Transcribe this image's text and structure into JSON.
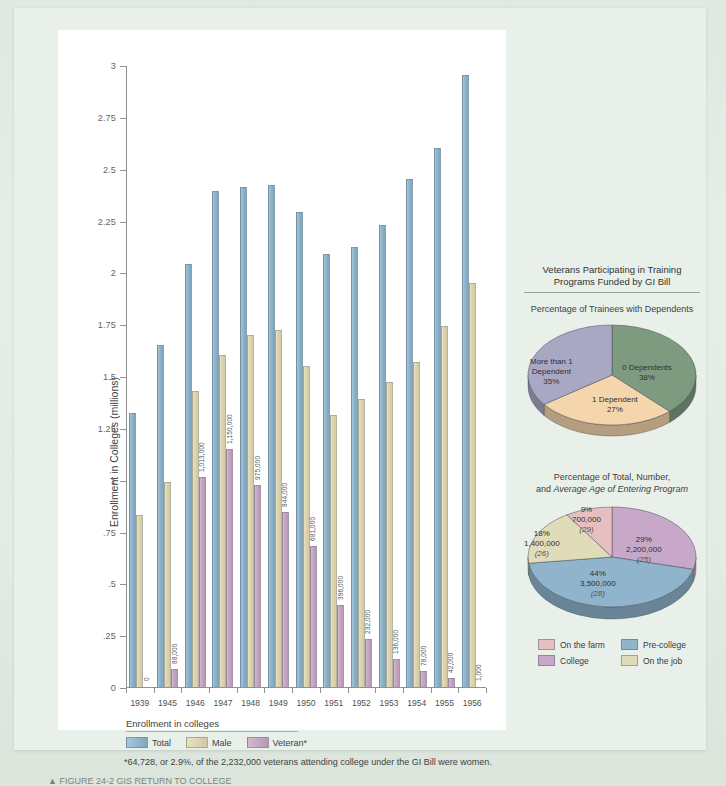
{
  "page": {
    "background_color": "#e2ebe2",
    "panel_color": "#ffffff"
  },
  "colors": {
    "total": "#8fb4cc",
    "male": "#ddd5b0",
    "veteran": "#c4a6c0",
    "pie1_zero": "#7e9b80",
    "pie1_one": "#f5d5ac",
    "pie1_more": "#a8a8c4",
    "pie2_farm": "#e8bfc0",
    "pie2_precollege": "#8fb4cc",
    "pie2_college": "#c8a8c8",
    "pie2_job": "#e0dcba"
  },
  "bar_legend": {
    "title": "Enrollment in colleges",
    "items": [
      {
        "label": "Total",
        "swatch": "sw-total"
      },
      {
        "label": "Male",
        "swatch": "sw-male"
      },
      {
        "label": "Veteran*",
        "swatch": "sw-vet"
      }
    ]
  },
  "footnote": "*64,728, or 2.9%, of the 2,232,000 veterans attending college under the GI Bill were women.",
  "caption": "▲ FIGURE 24-2  GIS RETURN TO COLLEGE",
  "chart_data": [
    {
      "type": "bar",
      "title": "",
      "xlabel": "",
      "ylabel": "Enrollment in Colleges (millions)",
      "ylim": [
        0,
        3
      ],
      "yticks": [
        0,
        0.25,
        0.5,
        0.75,
        1,
        1.25,
        1.5,
        1.75,
        2,
        2.25,
        2.5,
        2.75,
        3
      ],
      "ytick_labels": [
        "0",
        ".25",
        ".5",
        ".75",
        "1",
        "1.25",
        "1.5",
        "1.75",
        "2",
        "2.25",
        "2.5",
        "2.75",
        "3"
      ],
      "grid": false,
      "legend_position": "bottom-left",
      "categories": [
        "1939",
        "1945",
        "1946",
        "1947",
        "1948",
        "1949",
        "1950",
        "1951",
        "1952",
        "1953",
        "1954",
        "1955",
        "1956"
      ],
      "series": [
        {
          "name": "Total",
          "values": [
            1.32,
            1.65,
            2.04,
            2.39,
            2.41,
            2.42,
            2.29,
            2.09,
            2.12,
            2.23,
            2.45,
            2.6,
            2.95
          ]
        },
        {
          "name": "Male",
          "values": [
            0.83,
            0.99,
            1.43,
            1.6,
            1.7,
            1.72,
            1.55,
            1.31,
            1.39,
            1.47,
            1.57,
            1.74,
            1.95
          ]
        },
        {
          "name": "Veteran*",
          "values": [
            0.0,
            0.088,
            1.013,
            1.15,
            0.975,
            0.844,
            0.681,
            0.396,
            0.232,
            0.136,
            0.078,
            0.042,
            0.001
          ],
          "data_labels": [
            "0",
            "88,000",
            "1,013,000",
            "1,150,000",
            "975,000",
            "844,000",
            "681,000",
            "396,000",
            "232,000",
            "136,000",
            "78,000",
            "42,000",
            "1,000"
          ]
        }
      ]
    },
    {
      "type": "pie",
      "header": "Veterans Participating in Training Programs Funded by GI Bill",
      "title": "Percentage of Trainees with Dependents",
      "labels": [
        "0 Dependents",
        "1 Dependent",
        "More than 1 Dependent"
      ],
      "values": [
        38,
        27,
        35
      ],
      "value_labels": [
        "38%",
        "27%",
        "35%"
      ],
      "colors": [
        "#7e9b80",
        "#f5d5ac",
        "#a8a8c4"
      ],
      "legend_position": "none"
    },
    {
      "type": "pie",
      "title_line1": "Percentage of Total, Number,",
      "title_line2_prefix": "and ",
      "title_line2_italic": "Average Age of Entering Program",
      "labels": [
        "College",
        "Pre-college",
        "On the job",
        "On the farm"
      ],
      "values": [
        29,
        44,
        18,
        9
      ],
      "value_labels": [
        "29%",
        "44%",
        "18%",
        "9%"
      ],
      "number_labels": [
        "2,200,000",
        "3,500,000",
        "1,400,000",
        "700,000"
      ],
      "age_labels": [
        "(25)",
        "(28)",
        "(26)",
        "(29)"
      ],
      "colors": [
        "#c8a8c8",
        "#8fb4cc",
        "#e0dcba",
        "#e8bfc0"
      ],
      "legend": [
        {
          "label": "On the farm",
          "swatch": "sw-farm"
        },
        {
          "label": "Pre-college",
          "swatch": "sw-precol"
        },
        {
          "label": "College",
          "swatch": "sw-college"
        },
        {
          "label": "On the job",
          "swatch": "sw-job"
        }
      ],
      "legend_position": "bottom"
    }
  ]
}
